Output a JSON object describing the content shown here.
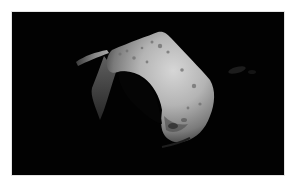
{
  "image": {
    "subject": "asteroid",
    "description": "Grayscale photograph of an irregular cratered asteroid lit from the upper right against black space",
    "colors": {
      "border": "#ffffff",
      "space": "#020202",
      "surface_light": "#d2d2d2",
      "surface_mid": "#9a9a9a",
      "surface_dark": "#3a3a3a"
    }
  }
}
